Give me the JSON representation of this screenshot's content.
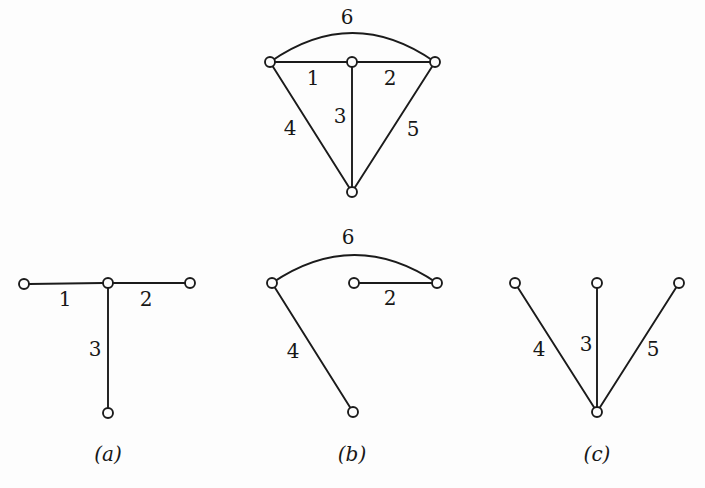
{
  "figure": {
    "title": "",
    "background_color": "#fdfdfd",
    "ink_color": "#1b1b1b",
    "node_radius": 5,
    "node_fill": "#fdfdfd",
    "width": 705,
    "height": 488
  },
  "graphs": [
    {
      "id": "graph-top",
      "caption": "",
      "caption_pos": null,
      "nodes": [
        {
          "id": "tl",
          "x": 270,
          "y": 62
        },
        {
          "id": "tm",
          "x": 352,
          "y": 62
        },
        {
          "id": "tr",
          "x": 435,
          "y": 62
        },
        {
          "id": "tb",
          "x": 352,
          "y": 192
        }
      ],
      "edges": [
        {
          "label": "1",
          "from": "tl",
          "to": "tm",
          "type": "line",
          "label_x": 313,
          "label_y": 79
        },
        {
          "label": "2",
          "from": "tm",
          "to": "tr",
          "type": "line",
          "label_x": 390,
          "label_y": 79
        },
        {
          "label": "3",
          "from": "tm",
          "to": "tb",
          "type": "line",
          "label_x": 340,
          "label_y": 117
        },
        {
          "label": "4",
          "from": "tl",
          "to": "tb",
          "type": "line",
          "label_x": 290,
          "label_y": 129
        },
        {
          "label": "5",
          "from": "tr",
          "to": "tb",
          "type": "line",
          "label_x": 413,
          "label_y": 130
        },
        {
          "label": "6",
          "from": "tl",
          "to": "tr",
          "type": "arc",
          "arc_apex_y": 33,
          "label_x": 347,
          "label_y": 18
        }
      ]
    },
    {
      "id": "graph-a",
      "caption": "(a)",
      "caption_pos": {
        "x": 108,
        "y": 455
      },
      "nodes": [
        {
          "id": "al",
          "x": 24,
          "y": 284
        },
        {
          "id": "am",
          "x": 108,
          "y": 283
        },
        {
          "id": "ar",
          "x": 190,
          "y": 283
        },
        {
          "id": "ab",
          "x": 108,
          "y": 413
        }
      ],
      "edges": [
        {
          "label": "1",
          "from": "al",
          "to": "am",
          "type": "line",
          "label_x": 65,
          "label_y": 300
        },
        {
          "label": "2",
          "from": "am",
          "to": "ar",
          "type": "line",
          "label_x": 146,
          "label_y": 300
        },
        {
          "label": "3",
          "from": "am",
          "to": "ab",
          "type": "line",
          "label_x": 95,
          "label_y": 350
        }
      ]
    },
    {
      "id": "graph-b",
      "caption": "(b)",
      "caption_pos": {
        "x": 352,
        "y": 455
      },
      "nodes": [
        {
          "id": "bl",
          "x": 272,
          "y": 283
        },
        {
          "id": "bm",
          "x": 354,
          "y": 283
        },
        {
          "id": "br",
          "x": 437,
          "y": 283
        },
        {
          "id": "bb",
          "x": 353,
          "y": 412
        }
      ],
      "edges": [
        {
          "label": "2",
          "from": "bm",
          "to": "br",
          "type": "line",
          "label_x": 390,
          "label_y": 299
        },
        {
          "label": "4",
          "from": "bl",
          "to": "bb",
          "type": "line",
          "label_x": 293,
          "label_y": 352
        },
        {
          "label": "6",
          "from": "bl",
          "to": "br",
          "type": "arc",
          "arc_apex_y": 255,
          "label_x": 348,
          "label_y": 238
        }
      ]
    },
    {
      "id": "graph-c",
      "caption": "(c)",
      "caption_pos": {
        "x": 597,
        "y": 455
      },
      "nodes": [
        {
          "id": "cl",
          "x": 515,
          "y": 283
        },
        {
          "id": "cm",
          "x": 597,
          "y": 283
        },
        {
          "id": "cr",
          "x": 679,
          "y": 283
        },
        {
          "id": "cb",
          "x": 597,
          "y": 412
        }
      ],
      "edges": [
        {
          "label": "3",
          "from": "cm",
          "to": "cb",
          "type": "line",
          "label_x": 586,
          "label_y": 345
        },
        {
          "label": "4",
          "from": "cl",
          "to": "cb",
          "type": "line",
          "label_x": 539,
          "label_y": 350
        },
        {
          "label": "5",
          "from": "cr",
          "to": "cb",
          "type": "line",
          "label_x": 653,
          "label_y": 350
        }
      ]
    }
  ]
}
